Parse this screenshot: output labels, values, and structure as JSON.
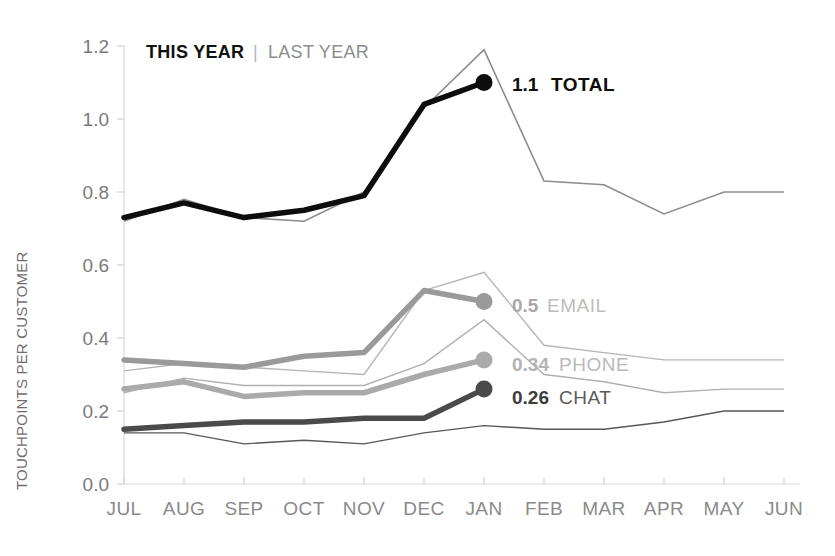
{
  "chart_data": {
    "type": "line",
    "title": "",
    "xlabel": "",
    "ylabel": "TOUCHPOINTS PER CUSTOMER",
    "ylim": [
      0.0,
      1.2
    ],
    "ytick_labels": [
      "0.0",
      "0.2",
      "0.4",
      "0.6",
      "0.8",
      "1.0",
      "1.2"
    ],
    "ytick_values": [
      0.0,
      0.2,
      0.4,
      0.6,
      0.8,
      1.0,
      1.2
    ],
    "grid": false,
    "legend_position": "top-left",
    "categories": [
      "JUL",
      "AUG",
      "SEP",
      "OCT",
      "NOV",
      "DEC",
      "JAN",
      "FEB",
      "MAR",
      "APR",
      "MAY",
      "JUN"
    ],
    "series": [
      {
        "name": "TOTAL",
        "period": "THIS YEAR",
        "color": "#0d0d0d",
        "width": 5.5,
        "endpoint_marker": true,
        "values": [
          0.73,
          0.77,
          0.73,
          0.75,
          0.79,
          1.04,
          1.1,
          null,
          null,
          null,
          null,
          null
        ]
      },
      {
        "name": "TOTAL",
        "period": "LAST YEAR",
        "color": "#8d8d8d",
        "width": 1.6,
        "endpoint_marker": false,
        "values": [
          0.72,
          0.78,
          0.73,
          0.72,
          0.8,
          1.03,
          1.19,
          0.83,
          0.82,
          0.74,
          0.8,
          0.8
        ]
      },
      {
        "name": "EMAIL",
        "period": "THIS YEAR",
        "color": "#9a9a9a",
        "width": 5.5,
        "endpoint_marker": true,
        "values": [
          0.34,
          0.33,
          0.32,
          0.35,
          0.36,
          0.53,
          0.5,
          null,
          null,
          null,
          null,
          null
        ]
      },
      {
        "name": "EMAIL",
        "period": "LAST YEAR",
        "color": "#b5b5b5",
        "width": 1.4,
        "endpoint_marker": false,
        "values": [
          0.31,
          0.33,
          0.32,
          0.31,
          0.3,
          0.53,
          0.58,
          0.38,
          0.36,
          0.34,
          0.34,
          0.34
        ]
      },
      {
        "name": "PHONE",
        "period": "THIS YEAR",
        "color": "#aaaaaa",
        "width": 5.5,
        "endpoint_marker": true,
        "values": [
          0.26,
          0.28,
          0.24,
          0.25,
          0.25,
          0.3,
          0.34,
          null,
          null,
          null,
          null,
          null
        ]
      },
      {
        "name": "PHONE",
        "period": "LAST YEAR",
        "color": "#b0b0b0",
        "width": 1.4,
        "endpoint_marker": false,
        "values": [
          0.25,
          0.29,
          0.27,
          0.27,
          0.27,
          0.33,
          0.45,
          0.3,
          0.28,
          0.25,
          0.26,
          0.26
        ]
      },
      {
        "name": "CHAT",
        "period": "THIS YEAR",
        "color": "#4a4a4a",
        "width": 5.5,
        "endpoint_marker": true,
        "values": [
          0.15,
          0.16,
          0.17,
          0.17,
          0.18,
          0.18,
          0.26,
          null,
          null,
          null,
          null,
          null
        ]
      },
      {
        "name": "CHAT",
        "period": "LAST YEAR",
        "color": "#575757",
        "width": 1.4,
        "endpoint_marker": false,
        "values": [
          0.14,
          0.14,
          0.11,
          0.12,
          0.11,
          0.14,
          0.16,
          0.15,
          0.15,
          0.17,
          0.2,
          0.2
        ]
      }
    ],
    "annotations": [
      {
        "id": "total",
        "value": "1.1",
        "name": "TOTAL",
        "at": {
          "x": "JAN",
          "y": 1.1
        }
      },
      {
        "id": "email",
        "value": "0.5",
        "name": "EMAIL",
        "at": {
          "x": "JAN",
          "y": 0.5
        }
      },
      {
        "id": "phone",
        "value": "0.34",
        "name": "PHONE",
        "at": {
          "x": "JAN",
          "y": 0.34
        }
      },
      {
        "id": "chat",
        "value": "0.26",
        "name": "CHAT",
        "at": {
          "x": "JAN",
          "y": 0.26
        }
      }
    ]
  },
  "legend": {
    "this_year": "THIS YEAR",
    "separator": "|",
    "last_year": "LAST YEAR"
  },
  "axis": {
    "y_title": "TOUCHPOINTS PER CUSTOMER"
  },
  "colors": {
    "total_this": "#0d0d0d",
    "total_last": "#8d8d8d",
    "email_this": "#9a9a9a",
    "phone_this": "#aaaaaa",
    "chat_this": "#4a4a4a",
    "axis": "#d9d9d9",
    "tick_text": "#8a8a8a"
  }
}
